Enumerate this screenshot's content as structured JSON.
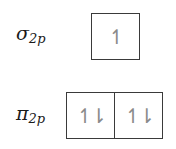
{
  "orbitals": [
    {
      "label_main": "σ",
      "label_sub": "2p",
      "cells": [
        {
          "electrons": "↿"
        }
      ]
    },
    {
      "label_main": "π",
      "label_sub": "2p",
      "cells": [
        {
          "electrons": "↿⇂"
        },
        {
          "electrons": "↿⇂"
        }
      ]
    }
  ]
}
